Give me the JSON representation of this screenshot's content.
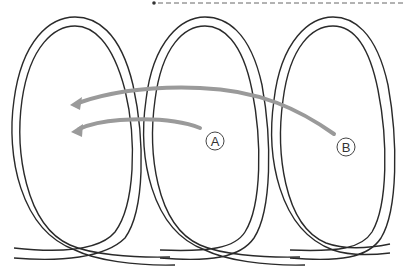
{
  "diagram": {
    "type": "rope-loops",
    "loop_count": 3,
    "labels": [
      {
        "id": "A",
        "text": "A"
      },
      {
        "id": "B",
        "text": "B"
      }
    ],
    "colors": {
      "rope": "#2a2a2a",
      "arrow": "#9a9a9a",
      "background": "#ffffff"
    }
  }
}
